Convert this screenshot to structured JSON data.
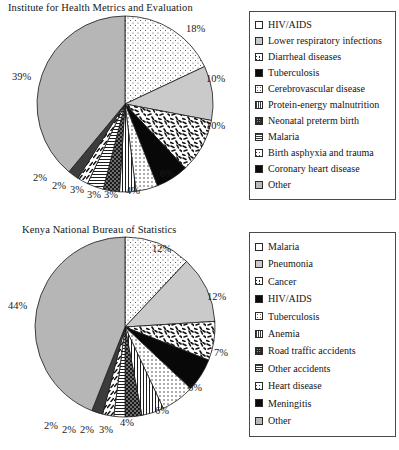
{
  "chart_data": [
    {
      "type": "pie",
      "title": "Institute for Health Metrics and Evaluation",
      "categories": [
        "HIV/AIDS",
        "Lower respiratory infections",
        "Diarrheal diseases",
        "Tuberculosis",
        "Cerebrovascular disease",
        "Protein-energy malnutrition",
        "Neonatal preterm birth",
        "Malaria",
        "Birth asphyxia and trauma",
        "Coronary heart disease",
        "Other"
      ],
      "values": [
        18,
        10,
        10,
        6,
        4,
        3,
        3,
        3,
        2,
        2,
        39
      ],
      "value_labels": [
        "18%",
        "10%",
        "10%",
        "6%",
        "4%",
        "3%",
        "3%",
        "3%",
        "2%",
        "2%",
        "39%"
      ],
      "patterns": [
        "dots-fine",
        "light-gray",
        "confetti",
        "black",
        "sparse-dots",
        "vlines",
        "dark-dots",
        "hlines",
        "diag-dash",
        "dark-solid",
        "gray"
      ],
      "legend_position": "right",
      "grid": false
    },
    {
      "type": "pie",
      "title": "Kenya National Bureau of Statistics",
      "categories": [
        "Malaria",
        "Pneumonia",
        "Cancer",
        "HIV/AIDS",
        "Tuberculosis",
        "Anemia",
        "Road traffic accidents",
        "Other accidents",
        "Heart disease",
        "Meningitis",
        "Other"
      ],
      "values": [
        12,
        12,
        7,
        6,
        6,
        4,
        3,
        2,
        2,
        2,
        44
      ],
      "value_labels": [
        "12%",
        "12%",
        "7%",
        "6%",
        "6%",
        "4%",
        "3%",
        "2%",
        "2%",
        "2%",
        "44%"
      ],
      "patterns": [
        "dots-fine",
        "light-gray",
        "confetti",
        "black",
        "sparse-dots",
        "vlines",
        "dark-dots",
        "hlines",
        "diag-dash",
        "dark-solid",
        "gray"
      ],
      "legend_position": "right",
      "grid": false
    }
  ],
  "charts": {
    "top": {
      "title": "Institute for Health Metrics and Evaluation",
      "legend": [
        {
          "label": "HIV/AIDS",
          "swatch": "dots-fine"
        },
        {
          "label": "Lower respiratory infections",
          "swatch": "light-gray"
        },
        {
          "label": "Diarrheal diseases",
          "swatch": "confetti"
        },
        {
          "label": "Tuberculosis",
          "swatch": "black"
        },
        {
          "label": "Cerebrovascular disease",
          "swatch": "sparse-dots"
        },
        {
          "label": "Protein-energy malnutrition",
          "swatch": "vlines"
        },
        {
          "label": "Neonatal preterm birth",
          "swatch": "dark-dots"
        },
        {
          "label": "Malaria",
          "swatch": "hlines"
        },
        {
          "label": "Birth asphyxia and trauma",
          "swatch": "diag-dash"
        },
        {
          "label": "Coronary heart disease",
          "swatch": "dark-solid"
        },
        {
          "label": "Other",
          "swatch": "gray"
        }
      ],
      "labels": [
        {
          "text": "18%",
          "x": 186,
          "y": 23
        },
        {
          "text": "10%",
          "x": 206,
          "y": 73
        },
        {
          "text": "10%",
          "x": 206,
          "y": 120
        },
        {
          "text": "6%",
          "x": 160,
          "y": 168
        },
        {
          "text": "4%",
          "x": 126,
          "y": 185
        },
        {
          "text": "3%",
          "x": 104,
          "y": 189
        },
        {
          "text": "3%",
          "x": 87,
          "y": 189
        },
        {
          "text": "3%",
          "x": 70,
          "y": 184
        },
        {
          "text": "2%",
          "x": 52,
          "y": 180
        },
        {
          "text": "2%",
          "x": 33,
          "y": 172
        },
        {
          "text": "39%",
          "x": 12,
          "y": 71
        }
      ]
    },
    "bottom": {
      "title": "Kenya National Bureau of Statistics",
      "legend": [
        {
          "label": "Malaria",
          "swatch": "dots-fine"
        },
        {
          "label": "Pneumonia",
          "swatch": "light-gray"
        },
        {
          "label": "Cancer",
          "swatch": "confetti"
        },
        {
          "label": "HIV/AIDS",
          "swatch": "black"
        },
        {
          "label": "Tuberculosis",
          "swatch": "sparse-dots"
        },
        {
          "label": "Anemia",
          "swatch": "vlines"
        },
        {
          "label": "Road traffic accidents",
          "swatch": "dark-dots"
        },
        {
          "label": "Other accidents",
          "swatch": "hlines"
        },
        {
          "label": "Heart disease",
          "swatch": "diag-dash"
        },
        {
          "label": "Meningitis",
          "swatch": "dark-solid"
        },
        {
          "label": "Other",
          "swatch": "gray"
        }
      ],
      "labels": [
        {
          "text": "12%",
          "x": 152,
          "y": 243
        },
        {
          "text": "12%",
          "x": 207,
          "y": 291
        },
        {
          "text": "7%",
          "x": 214,
          "y": 347
        },
        {
          "text": "6%",
          "x": 188,
          "y": 382
        },
        {
          "text": "6%",
          "x": 155,
          "y": 405
        },
        {
          "text": "4%",
          "x": 120,
          "y": 417
        },
        {
          "text": "3%",
          "x": 99,
          "y": 424
        },
        {
          "text": "2%",
          "x": 80,
          "y": 424
        },
        {
          "text": "2%",
          "x": 62,
          "y": 424
        },
        {
          "text": "2%",
          "x": 44,
          "y": 420
        },
        {
          "text": "44%",
          "x": 8,
          "y": 300
        }
      ]
    }
  }
}
